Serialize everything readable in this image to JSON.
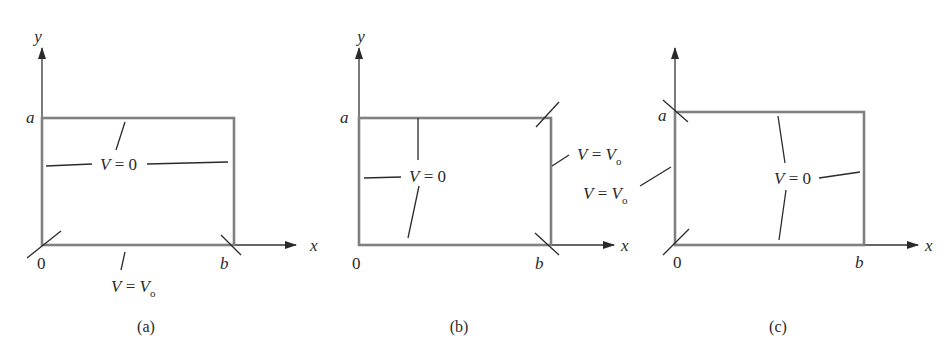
{
  "figure": {
    "panels": [
      {
        "id": "a",
        "caption": "(a)",
        "axes": {
          "x_label": "x",
          "y_label": "y",
          "origin": "0",
          "x_end": "b",
          "y_end": "a"
        },
        "boundaries": [
          {
            "side": "top",
            "label_var": "V",
            "label_eq": " = 0",
            "value": "V = 0"
          },
          {
            "side": "left",
            "value": "V = 0"
          },
          {
            "side": "right",
            "value": "V = 0"
          },
          {
            "side": "bottom",
            "label_var": "V",
            "label_eq": " = ",
            "label_val": "V",
            "label_sub": "o",
            "value": "V = Vo"
          }
        ]
      },
      {
        "id": "b",
        "caption": "(b)",
        "axes": {
          "x_label": "x",
          "y_label": "y",
          "origin": "0",
          "x_end": "b",
          "y_end": "a"
        },
        "boundaries": [
          {
            "side": "top",
            "label_var": "V",
            "label_eq": " = 0",
            "value": "V = 0"
          },
          {
            "side": "left",
            "value": "V = 0"
          },
          {
            "side": "bottom",
            "value": "V = 0"
          },
          {
            "side": "right",
            "label_var": "V",
            "label_eq": " = ",
            "label_val": "V",
            "label_sub": "o",
            "value": "V = Vo"
          }
        ]
      },
      {
        "id": "c",
        "caption": "(c)",
        "axes": {
          "x_label": "x",
          "origin": "0",
          "x_end": "b",
          "y_end": "a"
        },
        "boundaries": [
          {
            "side": "top",
            "label_var": "V",
            "label_eq": " = 0",
            "value": "V = 0"
          },
          {
            "side": "right",
            "value": "V = 0"
          },
          {
            "side": "bottom",
            "value": "V = 0"
          },
          {
            "side": "left",
            "label_var": "V",
            "label_eq": " = ",
            "label_val": "V",
            "label_sub": "o",
            "value": "V = Vo"
          }
        ]
      }
    ],
    "colors": {
      "box": "#808080",
      "axis": "#333333",
      "text": "#2a2a2a"
    }
  }
}
